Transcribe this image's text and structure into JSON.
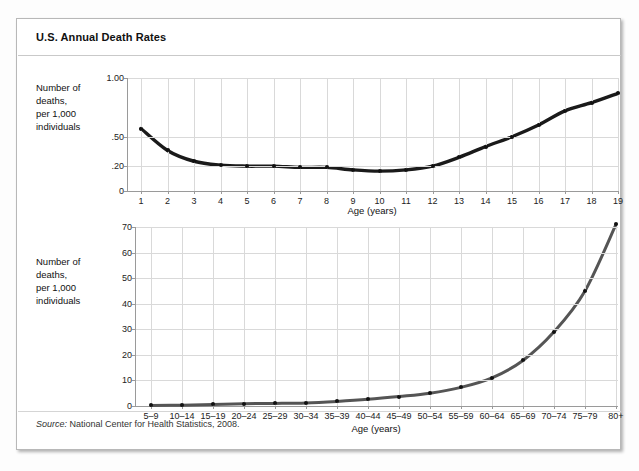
{
  "card": {
    "title": "U.S. Annual Death Rates",
    "source_label": "Source:",
    "source_text": " National Center for Health Statistics, 2008."
  },
  "colors": {
    "line_top": "#1a1a1a",
    "line_bottom": "#555555",
    "dot": "#111111",
    "grid": "#d9d9d9",
    "axis": "#9a9a9a",
    "card_border": "#b8b8b8"
  },
  "chart_data": [
    {
      "type": "line",
      "id": "annual-death-rates-ages-1-19",
      "title": "",
      "xlabel": "Age (years)",
      "ylabel": "Number of\ndeaths,\nper 1,000\nindividuals",
      "ylabel_lines": [
        "Number of",
        "deaths,",
        "per 1,000",
        "individuals"
      ],
      "grid": true,
      "legend": "none",
      "ylim": [
        0,
        1.0
      ],
      "y_scale": "nonlinear",
      "yticks": [
        0,
        0.2,
        0.5,
        1.0
      ],
      "ytick_labels": [
        "0",
        ".20",
        ".50",
        "1.00"
      ],
      "ytick_positions": [
        0,
        0.22,
        0.48,
        1.0
      ],
      "categories": [
        "1",
        "2",
        "3",
        "4",
        "5",
        "6",
        "7",
        "8",
        "9",
        "10",
        "11",
        "12",
        "13",
        "14",
        "15",
        "16",
        "17",
        "18",
        "19"
      ],
      "x": [
        1,
        2,
        3,
        4,
        5,
        6,
        7,
        8,
        9,
        10,
        11,
        12,
        13,
        14,
        15,
        16,
        17,
        18,
        19
      ],
      "values": [
        0.57,
        0.36,
        0.25,
        0.21,
        0.2,
        0.2,
        0.19,
        0.19,
        0.17,
        0.16,
        0.17,
        0.2,
        0.29,
        0.4,
        0.5,
        0.6,
        0.72,
        0.79,
        0.87
      ]
    },
    {
      "type": "line",
      "id": "annual-death-rates-age-groups",
      "title": "",
      "xlabel": "Age (years)",
      "ylabel": "Number of\ndeaths,\nper 1,000\nindividuals",
      "ylabel_lines": [
        "Number of",
        "deaths,",
        "per 1,000",
        "individuals"
      ],
      "grid": true,
      "legend": "none",
      "ylim": [
        0,
        70
      ],
      "y_scale": "linear",
      "yticks": [
        0,
        10,
        20,
        30,
        40,
        50,
        60,
        70
      ],
      "ytick_labels": [
        "0",
        "10",
        "20",
        "30",
        "40",
        "50",
        "60",
        "70"
      ],
      "categories": [
        "5–9",
        "10–14",
        "15–19",
        "20–24",
        "25–29",
        "30–34",
        "35–39",
        "40–44",
        "45–49",
        "50–54",
        "55–59",
        "60–64",
        "65–69",
        "70–74",
        "75–79",
        "80+"
      ],
      "values": [
        0.2,
        0.3,
        0.6,
        0.9,
        1.0,
        1.2,
        1.8,
        2.6,
        3.7,
        5.0,
        7.3,
        11.0,
        17.8,
        29.0,
        45.0,
        71.0
      ]
    }
  ]
}
